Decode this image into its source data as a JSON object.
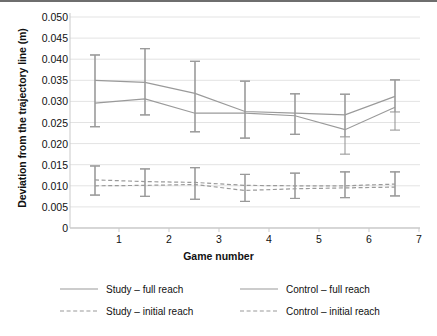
{
  "chart_data": {
    "type": "line",
    "title": "",
    "xlabel": "Game number",
    "ylabel": "Deviation from the trajectory line (m)",
    "categories": [
      1,
      2,
      3,
      4,
      5,
      6,
      7
    ],
    "x_tick_labels": [
      "1",
      "2",
      "3",
      "4",
      "5",
      "6",
      "7"
    ],
    "y_tick_labels": [
      "0.050",
      "0.045",
      "0.040",
      "0.035",
      "0.030",
      "0.025",
      "0.020",
      "0.015",
      "0.010",
      "0.005",
      "0"
    ],
    "y_tick_values": [
      0.05,
      0.045,
      0.04,
      0.035,
      0.03,
      0.025,
      0.02,
      0.015,
      0.01,
      0.005,
      0
    ],
    "ylim": [
      0,
      0.05
    ],
    "xlim": [
      0.5,
      7.5
    ],
    "grid": true,
    "grid_axis": "y",
    "legend_position": "bottom",
    "error_bars": true,
    "series": [
      {
        "name": "Study – full reach",
        "style": "solid",
        "color": "#9a9a9a",
        "values": [
          0.035,
          0.0345,
          0.0319,
          0.0276,
          0.0272,
          0.0268,
          0.0312
        ],
        "err_low": [
          0.024,
          0.0268,
          0.0228,
          0.0213,
          0.0222,
          0.0216,
          0.0275
        ],
        "err_high": [
          0.041,
          0.0425,
          0.0395,
          0.0348,
          0.0318,
          0.0317,
          0.0351
        ]
      },
      {
        "name": "Control – full reach",
        "style": "solid",
        "color": "#9a9a9a",
        "values": [
          0.0296,
          0.0306,
          0.0272,
          0.0272,
          0.0266,
          0.0233,
          0.0286
        ],
        "err_low": [
          0.024,
          0.0268,
          0.0228,
          0.0213,
          0.0222,
          0.0175,
          0.0232
        ],
        "err_high": [
          0.041,
          0.0425,
          0.0395,
          0.0348,
          0.0318,
          0.0317,
          0.0351
        ]
      },
      {
        "name": "Study – initial reach",
        "style": "dashed",
        "color": "#9a9a9a",
        "values": [
          0.0114,
          0.011,
          0.0108,
          0.0101,
          0.01,
          0.01,
          0.0104
        ],
        "err_low": [
          0.0078,
          0.0075,
          0.0068,
          0.0063,
          0.007,
          0.0072,
          0.0076
        ],
        "err_high": [
          0.0147,
          0.014,
          0.0143,
          0.0127,
          0.013,
          0.0133,
          0.0133
        ]
      },
      {
        "name": "Control – initial reach",
        "style": "dashed",
        "color": "#9a9a9a",
        "values": [
          0.01,
          0.0101,
          0.0103,
          0.0089,
          0.0093,
          0.0095,
          0.0097
        ],
        "err_low": [
          0.0078,
          0.0075,
          0.0068,
          0.0063,
          0.007,
          0.0072,
          0.0076
        ],
        "err_high": [
          0.0147,
          0.014,
          0.0143,
          0.0127,
          0.013,
          0.0133,
          0.0133
        ]
      }
    ],
    "legend": [
      {
        "label": "Study – full reach",
        "style": "solid",
        "color": "#9a9a9a"
      },
      {
        "label": "Control – full reach",
        "style": "solid",
        "color": "#9a9a9a"
      },
      {
        "label": "Study – initial reach",
        "style": "dashed",
        "color": "#9a9a9a"
      },
      {
        "label": "Control – initial reach",
        "style": "dashed",
        "color": "#9a9a9a"
      }
    ],
    "colors": {
      "line": "#9a9a9a",
      "grid": "#e3e3e3",
      "axis": "#c9c9c9",
      "text": "#111111",
      "border": "#6e6e6e"
    }
  }
}
